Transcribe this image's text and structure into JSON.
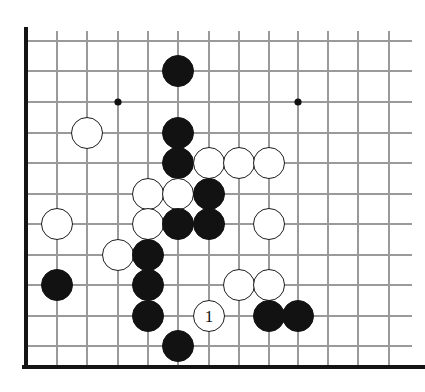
{
  "figure": {
    "kind": "go-board-diagram",
    "board_size_shown": {
      "columns": 13,
      "rows": 12
    },
    "colors": {
      "background": "#ffffff",
      "grid_line": "#9a9a9a",
      "board_edge": "#141414",
      "black_stone": "#121212",
      "white_stone": "#ffffff",
      "white_stone_outline": "#1d1d1d",
      "star_point": "#101010"
    }
  },
  "geometry": {
    "columns_x": [
      26,
      57,
      87,
      118,
      148,
      178,
      209,
      239,
      269,
      298,
      328,
      358,
      389
    ],
    "rows_y": [
      41,
      71,
      102,
      133,
      163,
      194,
      224,
      255,
      285,
      316,
      346
    ],
    "stone_radius": 16,
    "edges": {
      "left_x": 26,
      "bottom_y": 367,
      "top_y": 31,
      "right_x": 412
    }
  },
  "star_points": [
    {
      "name": "star-point-upper-left",
      "col": 3,
      "row": 2
    },
    {
      "name": "star-point-upper-right",
      "col": 9,
      "row": 2
    },
    {
      "name": "star-point-lower-left",
      "col": 3,
      "row": 7
    }
  ],
  "stones": [
    {
      "id": "b1",
      "color": "black",
      "col": 5,
      "row": 1,
      "label": ""
    },
    {
      "id": "w1",
      "color": "white",
      "col": 2,
      "row": 3,
      "label": ""
    },
    {
      "id": "b2",
      "color": "black",
      "col": 5,
      "row": 3,
      "label": ""
    },
    {
      "id": "b3",
      "color": "black",
      "col": 5,
      "row": 4,
      "label": ""
    },
    {
      "id": "w2",
      "color": "white",
      "col": 6,
      "row": 4,
      "label": ""
    },
    {
      "id": "w3",
      "color": "white",
      "col": 7,
      "row": 4,
      "label": ""
    },
    {
      "id": "w4",
      "color": "white",
      "col": 8,
      "row": 4,
      "label": ""
    },
    {
      "id": "w5",
      "color": "white",
      "col": 4,
      "row": 5,
      "label": ""
    },
    {
      "id": "w6",
      "color": "white",
      "col": 5,
      "row": 5,
      "label": ""
    },
    {
      "id": "b4",
      "color": "black",
      "col": 6,
      "row": 5,
      "label": ""
    },
    {
      "id": "w7",
      "color": "white",
      "col": 1,
      "row": 6,
      "label": ""
    },
    {
      "id": "w8",
      "color": "white",
      "col": 4,
      "row": 6,
      "label": ""
    },
    {
      "id": "b5",
      "color": "black",
      "col": 5,
      "row": 6,
      "label": ""
    },
    {
      "id": "b6",
      "color": "black",
      "col": 6,
      "row": 6,
      "label": ""
    },
    {
      "id": "w9",
      "color": "white",
      "col": 8,
      "row": 6,
      "label": ""
    },
    {
      "id": "w10",
      "color": "white",
      "col": 3,
      "row": 7,
      "label": ""
    },
    {
      "id": "b7",
      "color": "black",
      "col": 4,
      "row": 7,
      "label": ""
    },
    {
      "id": "b8",
      "color": "black",
      "col": 1,
      "row": 8,
      "label": ""
    },
    {
      "id": "b9",
      "color": "black",
      "col": 4,
      "row": 8,
      "label": ""
    },
    {
      "id": "w11",
      "color": "white",
      "col": 7,
      "row": 8,
      "label": ""
    },
    {
      "id": "w12",
      "color": "white",
      "col": 8,
      "row": 8,
      "label": ""
    },
    {
      "id": "b10",
      "color": "black",
      "col": 4,
      "row": 9,
      "label": ""
    },
    {
      "id": "w13",
      "color": "white",
      "col": 6,
      "row": 9,
      "label": "1"
    },
    {
      "id": "b11",
      "color": "black",
      "col": 8,
      "row": 9,
      "label": ""
    },
    {
      "id": "b12",
      "color": "black",
      "col": 9,
      "row": 9,
      "label": ""
    },
    {
      "id": "b13",
      "color": "black",
      "col": 5,
      "row": 10,
      "label": ""
    }
  ],
  "move_marker": {
    "number": "1",
    "color": "white",
    "col": 6,
    "row": 9
  }
}
